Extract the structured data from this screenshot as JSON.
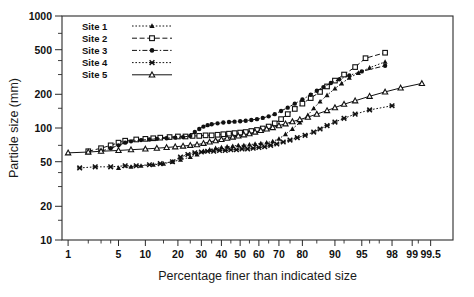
{
  "chart_data": {
    "type": "scatter",
    "title": "",
    "xlabel": "Percentage finer than indicated size",
    "ylabel": "Particle size (mm)",
    "x_scale": "probability",
    "y_scale": "log",
    "xlim": [
      0.8,
      99.8
    ],
    "ylim": [
      10,
      1000
    ],
    "grid": false,
    "legend_position": "top-left",
    "y_ticks": [
      10,
      20,
      50,
      100,
      200,
      500,
      1000
    ],
    "y_ticks_labels": [
      "10",
      "20",
      "50",
      "100",
      "200",
      "500",
      "1000"
    ],
    "y_minor_ticks": [
      15,
      30,
      40,
      70,
      150,
      300,
      400,
      700
    ],
    "x_ticks": [
      1,
      5,
      10,
      20,
      30,
      40,
      50,
      60,
      70,
      80,
      90,
      95,
      98,
      99,
      99.5
    ],
    "x_ticks_labels": [
      "1",
      "5",
      "10",
      "20",
      "30",
      "40",
      "50",
      "60",
      "70",
      "80",
      "90",
      "95",
      "98",
      "99",
      "99.5"
    ],
    "x_minor_ticks": [
      2,
      3,
      4,
      15,
      25,
      35,
      45,
      55,
      65,
      75,
      85,
      92,
      96,
      97,
      99.2
    ],
    "series": [
      {
        "name": "Site 1",
        "marker": "filled-triangle",
        "line": "dotted",
        "color": "#111111",
        "points": [
          [
            5,
            44
          ],
          [
            7,
            45
          ],
          [
            9,
            46
          ],
          [
            12,
            47
          ],
          [
            15,
            48
          ],
          [
            18,
            50
          ],
          [
            21,
            52
          ],
          [
            25,
            55
          ],
          [
            28,
            58
          ],
          [
            31,
            62
          ],
          [
            34,
            64
          ],
          [
            37,
            66
          ],
          [
            40,
            67
          ],
          [
            43,
            68
          ],
          [
            46,
            69
          ],
          [
            49,
            70
          ],
          [
            52,
            70
          ],
          [
            55,
            71
          ],
          [
            58,
            72
          ],
          [
            61,
            73
          ],
          [
            64,
            74
          ],
          [
            67,
            76
          ],
          [
            70,
            80
          ],
          [
            73,
            88
          ],
          [
            76,
            98
          ],
          [
            79,
            112
          ],
          [
            82,
            130
          ],
          [
            84,
            150
          ],
          [
            86,
            172
          ],
          [
            88,
            196
          ],
          [
            90,
            225
          ],
          [
            91.5,
            250
          ],
          [
            93,
            280
          ],
          [
            94.5,
            310
          ],
          [
            96,
            345
          ],
          [
            97.5,
            390
          ]
        ]
      },
      {
        "name": "Site 2",
        "marker": "open-square",
        "line": "dashed",
        "color": "#111111",
        "points": [
          [
            2,
            62
          ],
          [
            3,
            66
          ],
          [
            4,
            70
          ],
          [
            5,
            74
          ],
          [
            6,
            77
          ],
          [
            8,
            79
          ],
          [
            10,
            80
          ],
          [
            12,
            81
          ],
          [
            14,
            82
          ],
          [
            17,
            83
          ],
          [
            20,
            84
          ],
          [
            23,
            84
          ],
          [
            26,
            85
          ],
          [
            29,
            85
          ],
          [
            32,
            86
          ],
          [
            35,
            86
          ],
          [
            38,
            87
          ],
          [
            41,
            88
          ],
          [
            44,
            89
          ],
          [
            47,
            90
          ],
          [
            50,
            91
          ],
          [
            53,
            92
          ],
          [
            56,
            94
          ],
          [
            59,
            96
          ],
          [
            62,
            99
          ],
          [
            65,
            103
          ],
          [
            68,
            110
          ],
          [
            71,
            120
          ],
          [
            74,
            133
          ],
          [
            77,
            148
          ],
          [
            80,
            165
          ],
          [
            83,
            185
          ],
          [
            86,
            210
          ],
          [
            88,
            235
          ],
          [
            90,
            265
          ],
          [
            92,
            300
          ],
          [
            94,
            350
          ],
          [
            95.5,
            420
          ],
          [
            97.5,
            470
          ]
        ]
      },
      {
        "name": "Site 3",
        "marker": "filled-circle",
        "line": "dash-dot",
        "color": "#111111",
        "points": [
          [
            3,
            62
          ],
          [
            4,
            66
          ],
          [
            5,
            70
          ],
          [
            6,
            74
          ],
          [
            7,
            76
          ],
          [
            9,
            78
          ],
          [
            11,
            79
          ],
          [
            13,
            80
          ],
          [
            16,
            81
          ],
          [
            19,
            82
          ],
          [
            22,
            83
          ],
          [
            25,
            85
          ],
          [
            27,
            92
          ],
          [
            29,
            98
          ],
          [
            31,
            103
          ],
          [
            33,
            106
          ],
          [
            35,
            108
          ],
          [
            38,
            110
          ],
          [
            41,
            112
          ],
          [
            44,
            113
          ],
          [
            47,
            114
          ],
          [
            50,
            115
          ],
          [
            53,
            116
          ],
          [
            56,
            118
          ],
          [
            59,
            120
          ],
          [
            62,
            123
          ],
          [
            65,
            127
          ],
          [
            68,
            133
          ],
          [
            71,
            142
          ],
          [
            74,
            152
          ],
          [
            77,
            165
          ],
          [
            80,
            180
          ],
          [
            83,
            198
          ],
          [
            85,
            215
          ],
          [
            87,
            232
          ],
          [
            89,
            252
          ],
          [
            91,
            272
          ],
          [
            93,
            295
          ],
          [
            95,
            320
          ],
          [
            97.5,
            360
          ]
        ]
      },
      {
        "name": "Site 4",
        "marker": "x-cross",
        "line": "dotted",
        "color": "#111111",
        "points": [
          [
            1.5,
            44
          ],
          [
            2.5,
            45
          ],
          [
            4,
            45
          ],
          [
            6,
            46
          ],
          [
            8,
            46
          ],
          [
            11,
            47
          ],
          [
            14,
            48
          ],
          [
            18,
            50
          ],
          [
            21,
            55
          ],
          [
            24,
            58
          ],
          [
            27,
            60
          ],
          [
            30,
            61
          ],
          [
            33,
            62
          ],
          [
            36,
            62
          ],
          [
            39,
            63
          ],
          [
            42,
            63
          ],
          [
            45,
            64
          ],
          [
            48,
            64
          ],
          [
            51,
            65
          ],
          [
            54,
            65
          ],
          [
            57,
            66
          ],
          [
            60,
            67
          ],
          [
            63,
            68
          ],
          [
            66,
            70
          ],
          [
            69,
            72
          ],
          [
            72,
            75
          ],
          [
            75,
            78
          ],
          [
            78,
            82
          ],
          [
            81,
            86
          ],
          [
            84,
            92
          ],
          [
            86,
            98
          ],
          [
            88,
            105
          ],
          [
            90,
            113
          ],
          [
            92,
            122
          ],
          [
            94,
            133
          ],
          [
            96,
            145
          ],
          [
            98,
            158
          ]
        ]
      },
      {
        "name": "Site 5",
        "marker": "open-triangle",
        "line": "solid",
        "color": "#111111",
        "points": [
          [
            1,
            60
          ],
          [
            2,
            61
          ],
          [
            3,
            62
          ],
          [
            5,
            63
          ],
          [
            7,
            64
          ],
          [
            10,
            65
          ],
          [
            13,
            66
          ],
          [
            16,
            67
          ],
          [
            19,
            68
          ],
          [
            22,
            69
          ],
          [
            25,
            70
          ],
          [
            28,
            71
          ],
          [
            31,
            73
          ],
          [
            34,
            75
          ],
          [
            37,
            77
          ],
          [
            40,
            79
          ],
          [
            43,
            81
          ],
          [
            46,
            83
          ],
          [
            49,
            85
          ],
          [
            52,
            87
          ],
          [
            55,
            89
          ],
          [
            58,
            92
          ],
          [
            61,
            95
          ],
          [
            64,
            98
          ],
          [
            67,
            101
          ],
          [
            70,
            105
          ],
          [
            73,
            109
          ],
          [
            76,
            114
          ],
          [
            79,
            119
          ],
          [
            82,
            125
          ],
          [
            85,
            133
          ],
          [
            88,
            143
          ],
          [
            90,
            152
          ],
          [
            92,
            163
          ],
          [
            94,
            175
          ],
          [
            96,
            192
          ],
          [
            97.5,
            210
          ],
          [
            98.5,
            228
          ],
          [
            99.3,
            250
          ]
        ]
      }
    ]
  },
  "legend": {
    "items": [
      {
        "label": "Site 1"
      },
      {
        "label": "Site 2"
      },
      {
        "label": "Site 3"
      },
      {
        "label": "Site 4"
      },
      {
        "label": "Site 5"
      }
    ]
  }
}
